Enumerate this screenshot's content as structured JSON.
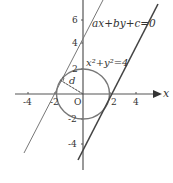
{
  "diagram": {
    "type": "coordinate-geometry",
    "axes": {
      "x_label": "x",
      "y_label": "y",
      "origin_label": "O",
      "x_ticks": [
        "-4",
        "-2",
        "2",
        "4"
      ],
      "y_ticks": [
        "6",
        "4",
        "2",
        "-2",
        "-4"
      ]
    },
    "circle": {
      "equation_label": "x²+y²=4",
      "center": [
        0,
        0
      ],
      "radius": 2
    },
    "lines": [
      {
        "name": "line-through-y4",
        "style": "thin"
      },
      {
        "name": "line-ax-by-c",
        "label": "ax+by+c=0",
        "style": "thick"
      }
    ],
    "distance_label": "d",
    "colors": {
      "stroke": "#555555",
      "text": "#333333"
    }
  }
}
